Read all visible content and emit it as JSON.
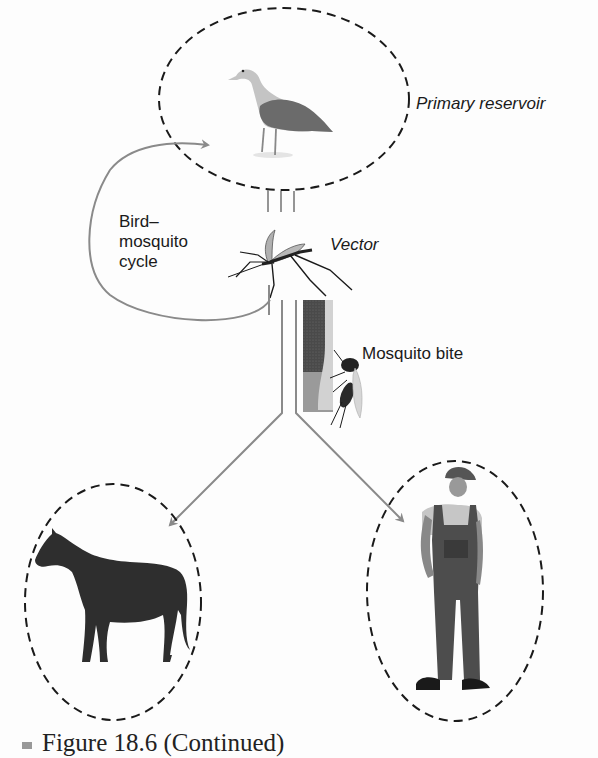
{
  "diagram": {
    "type": "transmission-cycle",
    "nodes": [
      {
        "id": "reservoir",
        "label": "Primary reservoir",
        "organism": "bird (gull)",
        "enclosure": "dashed-ellipse"
      },
      {
        "id": "vector",
        "label": "Vector",
        "organism": "mosquito"
      },
      {
        "id": "bite",
        "label": "Mosquito bite"
      },
      {
        "id": "horse",
        "label": "",
        "organism": "horse",
        "enclosure": "dashed-ellipse"
      },
      {
        "id": "human",
        "label": "",
        "organism": "human (farmer in overalls)",
        "enclosure": "dashed-ellipse"
      }
    ],
    "edges": [
      {
        "from": "vector",
        "to": "reservoir",
        "label": "Bird–mosquito cycle",
        "style": "curved-arrow"
      },
      {
        "from": "vector",
        "to": "horse",
        "style": "arrow"
      },
      {
        "from": "vector",
        "to": "human",
        "style": "arrow"
      }
    ]
  },
  "labels": {
    "primary_reservoir": "Primary reservoir",
    "bird_mosquito_cycle": "Bird–\nmosquito\ncycle",
    "vector": "Vector",
    "mosquito_bite": "Mosquito bite"
  },
  "caption": {
    "text": "Figure 18.6 (Continued)"
  },
  "colors": {
    "arrow": "#8a8a8a",
    "dashed_ellipse": "#1a1a1a",
    "text": "#1a1a1a",
    "horse": "#2b2b2b",
    "bird_body": "#6e6e6e",
    "bird_head": "#c8c8c8"
  }
}
